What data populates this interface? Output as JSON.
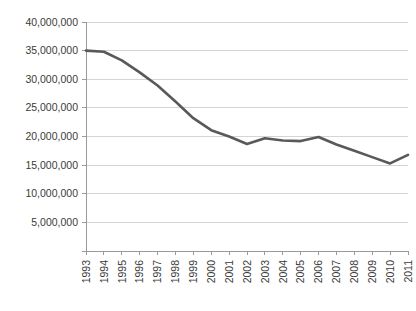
{
  "chart_data": {
    "type": "line",
    "title": "",
    "subtitle": "",
    "xlabel": "",
    "ylabel": "",
    "grid": "horizontal",
    "legend": "none",
    "xlim": [
      1993,
      2011
    ],
    "ylim": [
      0,
      40000000
    ],
    "x": [
      1993,
      1994,
      1995,
      1996,
      1997,
      1998,
      1999,
      2000,
      2001,
      2002,
      2003,
      2004,
      2005,
      2006,
      2007,
      2008,
      2009,
      2010,
      2011
    ],
    "categories": [
      "1993",
      "1994",
      "1995",
      "1996",
      "1997",
      "1998",
      "1999",
      "2000",
      "2001",
      "2002",
      "2003",
      "2004",
      "2005",
      "2006",
      "2007",
      "2008",
      "2009",
      "2010",
      "2011"
    ],
    "series": [
      {
        "name": "series-1",
        "color": "#595959",
        "values": [
          35000000,
          34800000,
          33300000,
          31200000,
          28900000,
          26100000,
          23200000,
          21100000,
          20000000,
          18700000,
          19700000,
          19300000,
          19200000,
          19900000,
          18600000,
          17500000,
          16400000,
          15300000,
          16800000
        ]
      }
    ],
    "yticks": [
      0,
      5000000,
      10000000,
      15000000,
      20000000,
      25000000,
      30000000,
      35000000,
      40000000
    ],
    "ytick_labels": [
      "",
      "5,000,000",
      "10,000,000",
      "15,000,000",
      "20,000,000",
      "25,000,000",
      "30,000,000",
      "35,000,000",
      "40,000,000"
    ],
    "xtick_labels": [
      "1993",
      "1994",
      "1995",
      "1996",
      "1997",
      "1998",
      "1999",
      "2000",
      "2001",
      "2002",
      "2003",
      "2004",
      "2005",
      "2006",
      "2007",
      "2008",
      "2009",
      "2010",
      "2011"
    ]
  },
  "style": {
    "background": "#ffffff",
    "gridline_color": "#d4d4d4",
    "axis_color": "#9a9a9a",
    "line_color": "#595959",
    "label_color": "#3a3a3a"
  }
}
